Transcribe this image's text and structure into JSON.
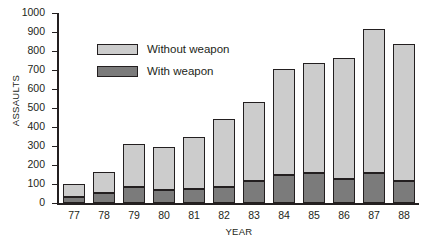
{
  "chart_data": {
    "type": "bar",
    "stacked": true,
    "title": "",
    "xlabel": "YEAR",
    "ylabel": "ASSAULTS",
    "categories": [
      "77",
      "78",
      "79",
      "80",
      "81",
      "82",
      "83",
      "84",
      "85",
      "86",
      "87",
      "88"
    ],
    "series": [
      {
        "name": "With weapon",
        "color": "#7b7b7b",
        "values": [
          30,
          55,
          85,
          70,
          75,
          85,
          115,
          145,
          160,
          125,
          160,
          115
        ]
      },
      {
        "name": "Without weapon",
        "color": "#cccccc",
        "values": [
          70,
          110,
          225,
          225,
          275,
          355,
          415,
          560,
          575,
          640,
          755,
          720
        ]
      }
    ],
    "totals": [
      100,
      165,
      310,
      295,
      350,
      440,
      530,
      705,
      735,
      765,
      915,
      835
    ],
    "yticks": [
      0,
      100,
      200,
      300,
      400,
      500,
      600,
      700,
      800,
      900,
      1000
    ],
    "ylim": [
      0,
      1000
    ],
    "ytick_labels": [
      "0",
      "100",
      "200",
      "300",
      "400",
      "500",
      "600",
      "700",
      "800",
      "900",
      "1000"
    ],
    "grid": false,
    "legend_position": "upper-left-inside",
    "legend": [
      {
        "label": "Without weapon",
        "color": "#cccccc"
      },
      {
        "label": "With weapon",
        "color": "#7b7b7b"
      }
    ]
  }
}
